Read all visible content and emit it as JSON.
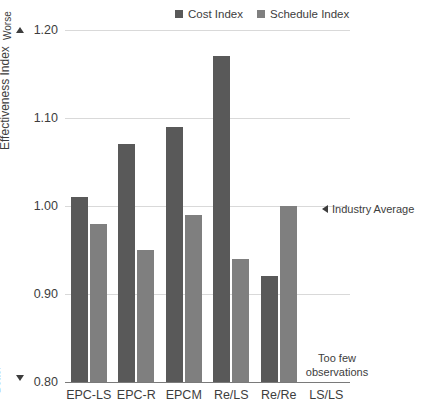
{
  "chart_data": {
    "type": "bar",
    "title": "",
    "xlabel": "",
    "ylabel": "Effectiveness Index",
    "ylim": [
      0.8,
      1.2
    ],
    "ytick_labels": [
      "1.20",
      "1.10",
      "1.00",
      "0.90",
      "0.80"
    ],
    "yticks": [
      1.2,
      1.1,
      1.0,
      0.9,
      0.8
    ],
    "grid": true,
    "legend_position": "top-center",
    "categories": [
      "EPC-LS",
      "EPC-R",
      "EPCM",
      "Re/LS",
      "Re/Re",
      "LS/LS"
    ],
    "series": [
      {
        "name": "Cost Index",
        "color": "#595959",
        "values": [
          1.01,
          1.07,
          1.09,
          1.17,
          0.92,
          null
        ]
      },
      {
        "name": "Schedule Index",
        "color": "#7f7f7f",
        "values": [
          0.98,
          0.95,
          0.99,
          0.94,
          1.0,
          null
        ]
      }
    ],
    "annotations": [
      {
        "name": "industry-average",
        "text": "Industry Average",
        "value": 1.0,
        "marker": "left-triangle"
      },
      {
        "name": "too-few-observations",
        "text": "Too few observations",
        "category": "LS/LS"
      },
      {
        "name": "direction-worse",
        "text": "Worse",
        "marker": "up-triangle"
      },
      {
        "name": "direction-better",
        "text": "Better",
        "marker": "down-triangle"
      }
    ]
  },
  "axis": {
    "y_title": "Effectiveness Index",
    "worse_label": "Worse",
    "better_label": "Better",
    "tick_1_20": "1.20",
    "tick_1_10": "1.10",
    "tick_1_00": "1.00",
    "tick_0_90": "0.90",
    "tick_0_80": "0.80"
  },
  "legend": {
    "items": [
      {
        "label": "Cost Index",
        "color": "#595959"
      },
      {
        "label": "Schedule Index",
        "color": "#7f7f7f"
      }
    ]
  },
  "annotations": {
    "industry_average": "Industry Average",
    "too_few_line1": "Too few",
    "too_few_line2": "observations"
  },
  "colors": {
    "cost": "#595959",
    "schedule": "#7f7f7f",
    "grid": "#d9d9d9",
    "axis": "#7a7a7a",
    "text": "#3d3d3d"
  }
}
